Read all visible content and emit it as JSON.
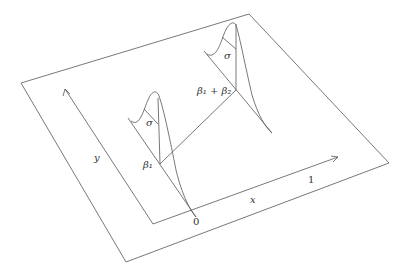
{
  "diagram": {
    "labels": {
      "y_axis": "y",
      "x_axis": "x",
      "origin": "0",
      "x_tick": "1",
      "beta1": "β₁",
      "beta1_plus_beta2": "β₁ + β₂",
      "sigma_left": "σ",
      "sigma_right": "σ"
    },
    "colors": {
      "line": "#555555",
      "text": "#333333",
      "background": "#ffffff"
    }
  }
}
